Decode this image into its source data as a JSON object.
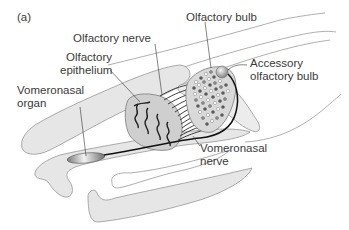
{
  "figure": {
    "panel_label": "(a)",
    "labels": {
      "olfactory_bulb": "Olfactory bulb",
      "olfactory_nerve": "Olfactory nerve",
      "olfactory_epithelium_line1": "Olfactory",
      "olfactory_epithelium_line2": "epithelium",
      "accessory_bulb_line1": "Accessory",
      "accessory_bulb_line2": "olfactory bulb",
      "vomeronasal_organ_line1": "Vomeronasal",
      "vomeronasal_organ_line2": "organ",
      "vomeronasal_nerve_line1": "Vomeronasal",
      "vomeronasal_nerve_line2": "nerve"
    },
    "colors": {
      "tissue_fill": "#e6e6e6",
      "outline": "#8a8a8a",
      "nerve": "#222222",
      "label_text": "#3a3a3a",
      "epithelium_fill": "#cfcfcf",
      "bulb_fill": "#d9d9d9"
    }
  }
}
